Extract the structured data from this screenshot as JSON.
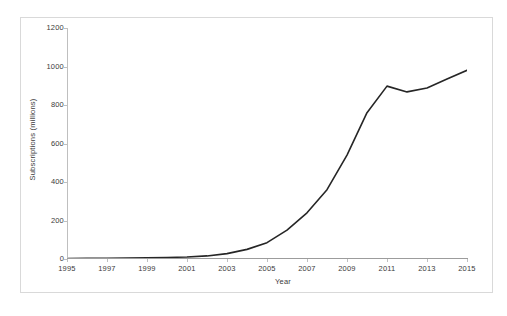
{
  "chart_data": {
    "type": "line",
    "title": "",
    "xlabel": "Year",
    "ylabel": "Subscriptions (millions)",
    "xlim": [
      1995,
      2015
    ],
    "ylim": [
      0,
      1200
    ],
    "grid": false,
    "legend": null,
    "line_color": "#262626",
    "x_tick_labels": [
      "1995",
      "1997",
      "1999",
      "2001",
      "2003",
      "2005",
      "2007",
      "2009",
      "2011",
      "2013",
      "2015"
    ],
    "y_tick_labels": [
      "0",
      "200",
      "400",
      "600",
      "800",
      "1000",
      "1200"
    ],
    "y_ticks": [
      0,
      200,
      400,
      600,
      800,
      1000,
      1200
    ],
    "x_ticks": [
      1995,
      1997,
      1999,
      2001,
      2003,
      2005,
      2007,
      2009,
      2011,
      2013,
      2015
    ],
    "series": [
      {
        "name": "Subscriptions",
        "x": [
          1995,
          1996,
          1997,
          1998,
          1999,
          2000,
          2001,
          2002,
          2003,
          2004,
          2005,
          2006,
          2007,
          2008,
          2009,
          2010,
          2011,
          2012,
          2013,
          2014,
          2015
        ],
        "values": [
          2,
          3,
          4,
          5,
          6,
          8,
          10,
          16,
          28,
          50,
          85,
          150,
          240,
          360,
          540,
          760,
          898,
          868,
          888,
          935,
          980
        ]
      }
    ]
  },
  "axes": {
    "x_title": "Year",
    "y_title": "Subscriptions (millions)"
  },
  "colors": {
    "line": "#262626",
    "axis": "#bfbfbf",
    "frame": "#d9d9d9",
    "text": "#3b3b3b",
    "background": "#ffffff"
  }
}
